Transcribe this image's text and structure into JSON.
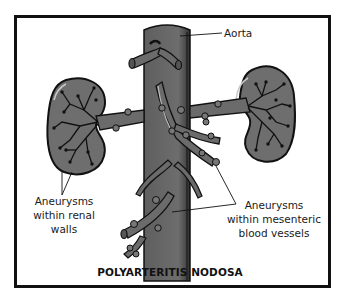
{
  "figure": {
    "title": "POLYARTERITIS NODOSA",
    "labels": {
      "aorta": "Aorta",
      "renal": [
        "Aneurysms",
        "within renal",
        "walls"
      ],
      "mesenteric": [
        "Aneurysms",
        "within mesenteric",
        "blood vessels"
      ]
    },
    "colors": {
      "vessel_fill": "#6b6b6b",
      "vessel_dark": "#3a3a3a",
      "kidney_fill": "#6e6e6e",
      "outline": "#111111",
      "highlight": "#bdbdbd",
      "background": "#ffffff"
    },
    "icons": [
      "aorta-illustration",
      "left-kidney-illustration",
      "right-kidney-illustration",
      "renal-artery-illustration",
      "mesenteric-vessels-illustration"
    ]
  }
}
